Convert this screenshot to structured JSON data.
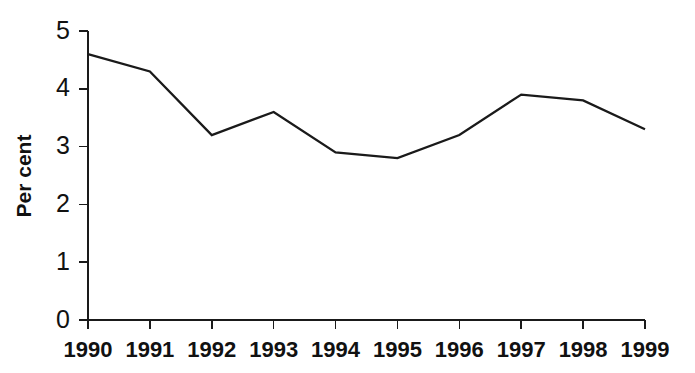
{
  "chart_data": {
    "type": "line",
    "title": "",
    "subtitle": "",
    "xlabel": "",
    "ylabel": "Per cent",
    "categories": [
      "1990",
      "1991",
      "1992",
      "1993",
      "1994",
      "1995",
      "1996",
      "1997",
      "1998",
      "1999"
    ],
    "values": [
      4.6,
      4.3,
      3.2,
      3.6,
      2.9,
      2.8,
      3.2,
      3.9,
      3.8,
      3.3
    ],
    "series": [
      {
        "name": "",
        "values": [
          4.6,
          4.3,
          3.2,
          3.6,
          2.9,
          2.8,
          3.2,
          3.9,
          3.8,
          3.3
        ]
      }
    ],
    "ylim": [
      0,
      5
    ],
    "y_ticks": [
      "0",
      "1",
      "2",
      "3",
      "4",
      "5"
    ],
    "x_ticks": [
      "1990",
      "1991",
      "1992",
      "1993",
      "1994",
      "1995",
      "1996",
      "1997",
      "1998",
      "1999"
    ],
    "grid": false,
    "legend": false,
    "legend_position": "none",
    "markers": false,
    "line_color": "#1a1a1a",
    "background_color": "#ffffff",
    "annotations": []
  }
}
